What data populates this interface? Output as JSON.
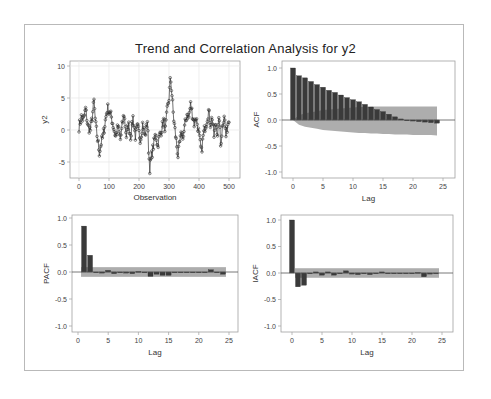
{
  "title": "Trend and Correlation Analysis for y2",
  "colors": {
    "bar": "#3a3a3a",
    "band": "#a9a9a9",
    "frame": "#a0a0a0",
    "grid": "#e6e6e6",
    "series": "#333333",
    "zero_line": "#555555"
  },
  "chart_data": [
    {
      "id": "series",
      "type": "line",
      "title": "",
      "xlabel": "Observation",
      "ylabel": "y2",
      "xlim": [
        0,
        500
      ],
      "ylim": [
        -7.5,
        10.5
      ],
      "xticks": [
        0,
        100,
        200,
        300,
        400,
        500
      ],
      "yticks": [
        -5,
        0,
        5,
        10
      ],
      "grid": true,
      "markers": "circle",
      "x": [],
      "y_keypoints": [
        [
          0,
          0.5
        ],
        [
          8,
          2.0
        ],
        [
          15,
          1.5
        ],
        [
          22,
          3.3
        ],
        [
          30,
          0.5
        ],
        [
          38,
          0.0
        ],
        [
          44,
          2.0
        ],
        [
          50,
          4.5
        ],
        [
          55,
          1.0
        ],
        [
          62,
          -1.5
        ],
        [
          68,
          -3.5
        ],
        [
          74,
          -2.0
        ],
        [
          80,
          -1.0
        ],
        [
          88,
          1.5
        ],
        [
          95,
          3.5
        ],
        [
          100,
          3.0
        ],
        [
          108,
          2.0
        ],
        [
          115,
          0.5
        ],
        [
          122,
          -1.0
        ],
        [
          130,
          0.5
        ],
        [
          138,
          -1.5
        ],
        [
          145,
          1.0
        ],
        [
          150,
          2.5
        ],
        [
          158,
          -1.0
        ],
        [
          165,
          1.0
        ],
        [
          172,
          -1.0
        ],
        [
          180,
          2.0
        ],
        [
          188,
          -1.0
        ],
        [
          195,
          0.5
        ],
        [
          205,
          -1.5
        ],
        [
          212,
          1.0
        ],
        [
          220,
          -1.0
        ],
        [
          228,
          1.5
        ],
        [
          232,
          -3.0
        ],
        [
          236,
          -6.0
        ],
        [
          242,
          -4.0
        ],
        [
          250,
          -2.0
        ],
        [
          256,
          -0.5
        ],
        [
          262,
          -2.5
        ],
        [
          268,
          -1.0
        ],
        [
          275,
          0.0
        ],
        [
          282,
          1.5
        ],
        [
          288,
          0.0
        ],
        [
          294,
          3.0
        ],
        [
          300,
          5.0
        ],
        [
          305,
          8.2
        ],
        [
          310,
          5.5
        ],
        [
          315,
          2.0
        ],
        [
          320,
          0.0
        ],
        [
          326,
          -2.5
        ],
        [
          330,
          -4.0
        ],
        [
          336,
          -2.0
        ],
        [
          342,
          -0.5
        ],
        [
          348,
          -1.0
        ],
        [
          354,
          1.0
        ],
        [
          360,
          2.5
        ],
        [
          366,
          2.0
        ],
        [
          372,
          4.0
        ],
        [
          378,
          2.5
        ],
        [
          384,
          1.0
        ],
        [
          390,
          2.0
        ],
        [
          396,
          0.5
        ],
        [
          402,
          -1.5
        ],
        [
          408,
          -3.5
        ],
        [
          414,
          -1.0
        ],
        [
          420,
          0.5
        ],
        [
          426,
          1.5
        ],
        [
          432,
          3.0
        ],
        [
          438,
          1.0
        ],
        [
          444,
          2.0
        ],
        [
          450,
          -1.0
        ],
        [
          456,
          1.0
        ],
        [
          462,
          -0.5
        ],
        [
          468,
          2.0
        ],
        [
          472,
          -2.5
        ],
        [
          478,
          0.5
        ],
        [
          484,
          2.5
        ],
        [
          490,
          -1.0
        ],
        [
          496,
          1.0
        ],
        [
          500,
          2.0
        ]
      ]
    },
    {
      "id": "acf",
      "type": "bar",
      "title": "",
      "xlabel": "Lag",
      "ylabel": "ACF",
      "xlim": [
        -1.5,
        26
      ],
      "ylim": [
        -1.1,
        1.1
      ],
      "xticks": [
        0,
        5,
        10,
        15,
        20,
        25
      ],
      "yticks": [
        -1.0,
        -0.5,
        0.0,
        0.5,
        1.0
      ],
      "yticklabels": [
        "-1.0",
        "-0.5",
        "0.0",
        "0.5",
        "1.0"
      ],
      "categories": [
        0,
        1,
        2,
        3,
        4,
        5,
        6,
        7,
        8,
        9,
        10,
        11,
        12,
        13,
        14,
        15,
        16,
        17,
        18,
        19,
        20,
        21,
        22,
        23,
        24
      ],
      "values": [
        1.0,
        0.85,
        0.81,
        0.74,
        0.68,
        0.63,
        0.57,
        0.53,
        0.48,
        0.43,
        0.39,
        0.35,
        0.3,
        0.25,
        0.2,
        0.16,
        0.11,
        0.06,
        0.02,
        -0.01,
        -0.02,
        -0.03,
        -0.04,
        -0.05,
        -0.06
      ],
      "band_upper": [
        0.0,
        0.09,
        0.13,
        0.15,
        0.17,
        0.19,
        0.2,
        0.21,
        0.22,
        0.23,
        0.24,
        0.25,
        0.25,
        0.26,
        0.26,
        0.26,
        0.26,
        0.26,
        0.26,
        0.26,
        0.26,
        0.26,
        0.26,
        0.26,
        0.26
      ],
      "band_lower": [
        0.0,
        -0.09,
        -0.13,
        -0.15,
        -0.17,
        -0.19,
        -0.2,
        -0.21,
        -0.22,
        -0.23,
        -0.24,
        -0.25,
        -0.25,
        -0.26,
        -0.26,
        -0.27,
        -0.27,
        -0.28,
        -0.28,
        -0.28,
        -0.29,
        -0.29,
        -0.29,
        -0.29,
        -0.3
      ],
      "band_style": "acf"
    },
    {
      "id": "pacf",
      "type": "bar",
      "title": "",
      "xlabel": "Lag",
      "ylabel": "PACF",
      "xlim": [
        -1.5,
        26
      ],
      "ylim": [
        -1.1,
        1.1
      ],
      "xticks": [
        0,
        5,
        10,
        15,
        20,
        25
      ],
      "yticks": [
        -1.0,
        -0.5,
        0.0,
        0.5,
        1.0
      ],
      "yticklabels": [
        "-1.0",
        "-0.5",
        "0.0",
        "0.5",
        "1.0"
      ],
      "categories": [
        1,
        2,
        3,
        4,
        5,
        6,
        7,
        8,
        9,
        10,
        11,
        12,
        13,
        14,
        15,
        16,
        17,
        18,
        19,
        20,
        21,
        22,
        23,
        24
      ],
      "values": [
        0.85,
        0.31,
        0.0,
        -0.02,
        0.03,
        -0.03,
        -0.01,
        -0.02,
        -0.03,
        0.01,
        0.0,
        -0.08,
        -0.04,
        -0.06,
        -0.06,
        0.0,
        -0.01,
        0.0,
        0.0,
        -0.01,
        -0.01,
        0.04,
        0.0,
        -0.04
      ],
      "band": 0.09,
      "band_from": 1,
      "band_to": 24
    },
    {
      "id": "iacf",
      "type": "bar",
      "title": "",
      "xlabel": "Lag",
      "ylabel": "IACF",
      "xlim": [
        -1.5,
        26
      ],
      "ylim": [
        -1.1,
        1.1
      ],
      "xticks": [
        0,
        5,
        10,
        15,
        20,
        25
      ],
      "yticks": [
        -1.0,
        -0.5,
        0.0,
        0.5,
        1.0
      ],
      "yticklabels": [
        "-1.0",
        "-0.5",
        "0.0",
        "0.5",
        "1.0"
      ],
      "categories": [
        0,
        1,
        2,
        3,
        4,
        5,
        6,
        7,
        8,
        9,
        10,
        11,
        12,
        13,
        14,
        15,
        16,
        17,
        18,
        19,
        20,
        21,
        22,
        23,
        24
      ],
      "values": [
        1.0,
        -0.26,
        -0.23,
        -0.01,
        0.02,
        -0.04,
        0.02,
        -0.04,
        0.0,
        0.04,
        -0.02,
        -0.03,
        0.0,
        -0.03,
        0.0,
        0.02,
        -0.01,
        0.0,
        0.0,
        0.0,
        0.0,
        0.01,
        -0.07,
        -0.02,
        0.0
      ],
      "band": 0.09,
      "band_from": 1,
      "band_to": 24
    }
  ]
}
